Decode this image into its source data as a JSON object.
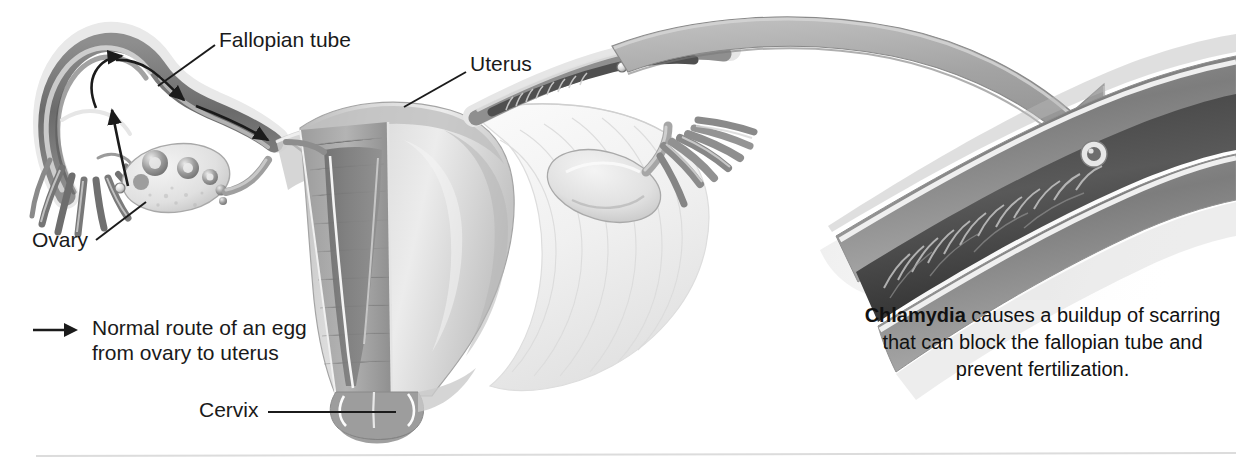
{
  "figure": {
    "style": "grayscale medical illustration",
    "background_color": "#ffffff",
    "width": 1236,
    "height": 469
  },
  "labels": {
    "fallopian_tube": "Fallopian tube",
    "uterus": "Uterus",
    "ovary": "Ovary",
    "cervix": "Cervix"
  },
  "legend": {
    "arrow_icon": "right-arrow-icon",
    "text": "Normal route of an egg\nfrom ovary to uterus"
  },
  "caption": {
    "term": "Chlamydia",
    "rest": " causes a buildup of scarring that can block the fallopian tube and prevent fertilization.",
    "full_text": "Chlamydia causes a buildup of scarring that can block the fallopian tube and prevent fertilization.",
    "lines": [
      "Chlamydia causes a buildup",
      "of scarring that can block",
      "the fallopian tube and",
      "prevent fertilization."
    ]
  },
  "anatomy": {
    "parts": [
      "left fallopian tube",
      "left fimbriae",
      "left ovary with follicles",
      "uterus body cutaway",
      "endometrial cavity",
      "cervix",
      "right fallopian tube",
      "right fimbriae",
      "right ovary",
      "broad ligament",
      "magnified scarred fallopian tube"
    ],
    "egg_path_arrow_count": 4,
    "magnifier_arrow": "curved-pointer-arrow"
  },
  "colors": {
    "ink": "#1a1a1a",
    "tissue_dark": "#6f6f6f",
    "tissue_mid": "#9c9c9c",
    "tissue_light": "#d6d6d6",
    "tissue_pale": "#ededed",
    "highlight": "#ffffff",
    "rule": "#dcdcdc",
    "arrow_fill": "#a6a6a6"
  },
  "divider": {
    "present": true,
    "color": "#dcdcdc"
  }
}
